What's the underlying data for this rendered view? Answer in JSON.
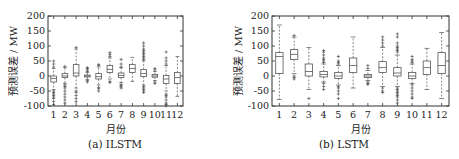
{
  "chart_data": [
    {
      "type": "box",
      "title": "",
      "caption": "(a) ILSTM",
      "xlabel": "月份",
      "ylabel": "预测误差 / MW",
      "ylim": [
        -100,
        200
      ],
      "yticks": [
        -100,
        -50,
        0,
        50,
        100,
        150,
        200
      ],
      "categories": [
        "1",
        "2",
        "3",
        "4",
        "5",
        "6",
        "7",
        "8",
        "9",
        "10",
        "11",
        "12"
      ],
      "boxes": [
        {
          "month": "1",
          "whisker_low": -45,
          "q1": -20,
          "median": -8,
          "q3": 0,
          "whisker_high": 25,
          "outliers": [
            30,
            40,
            50,
            -50,
            -55,
            -60,
            -65,
            -70,
            -75,
            -85,
            -95
          ]
        },
        {
          "month": "2",
          "whisker_low": -25,
          "q1": -5,
          "median": 0,
          "q3": 8,
          "whisker_high": 28,
          "outliers": [
            32,
            -30,
            -35,
            -40,
            -50,
            -60,
            -70,
            -80,
            -90
          ]
        },
        {
          "month": "3",
          "whisker_low": -40,
          "q1": 0,
          "median": 10,
          "q3": 38,
          "whisker_high": 90,
          "outliers": [
            95,
            -50,
            -55,
            -65,
            -75,
            -85
          ]
        },
        {
          "month": "4",
          "whisker_low": -12,
          "q1": -3,
          "median": 0,
          "q3": 3,
          "whisker_high": 12,
          "outliers": [
            15,
            20,
            25,
            28,
            -15,
            -20
          ]
        },
        {
          "month": "5",
          "whisker_low": -30,
          "q1": -10,
          "median": -2,
          "q3": 8,
          "whisker_high": 30,
          "outliers": [
            35,
            38,
            -38,
            -42,
            -50
          ]
        },
        {
          "month": "6",
          "whisker_low": -10,
          "q1": 12,
          "median": 22,
          "q3": 35,
          "whisker_high": 60,
          "outliers": [
            65,
            72,
            78,
            -18,
            -22
          ]
        },
        {
          "month": "7",
          "whisker_low": -22,
          "q1": -5,
          "median": 2,
          "q3": 10,
          "whisker_high": 28,
          "outliers": [
            30,
            40,
            55,
            -28,
            -32,
            -36,
            -40
          ]
        },
        {
          "month": "8",
          "whisker_low": -18,
          "q1": 12,
          "median": 25,
          "q3": 38,
          "whisker_high": 62,
          "outliers": []
        },
        {
          "month": "9",
          "whisker_low": -30,
          "q1": -2,
          "median": 8,
          "q3": 22,
          "whisker_high": 50,
          "outliers": [
            55,
            60,
            65,
            70,
            75,
            80,
            85,
            90,
            100,
            110,
            -35,
            -40,
            -45,
            -50,
            -55
          ]
        },
        {
          "month": "10",
          "whisker_low": -15,
          "q1": -4,
          "median": 0,
          "q3": 5,
          "whisker_high": 15,
          "outliers": [
            20,
            25,
            -20,
            -25
          ]
        },
        {
          "month": "11",
          "whisker_low": -50,
          "q1": -25,
          "median": -10,
          "q3": 2,
          "whisker_high": 35,
          "outliers": [
            40,
            50,
            60,
            80,
            -60,
            -65,
            -70,
            -80,
            -90,
            -95,
            -100
          ]
        },
        {
          "month": "12",
          "whisker_low": -68,
          "q1": -25,
          "median": -5,
          "q3": 12,
          "whisker_high": 65,
          "outliers": []
        }
      ]
    },
    {
      "type": "box",
      "title": "",
      "caption": "(b) LSTM",
      "xlabel": "月份",
      "ylabel": "预测误差 / MW",
      "ylim": [
        -100,
        200
      ],
      "yticks": [
        -100,
        -50,
        0,
        50,
        100,
        150,
        200
      ],
      "categories": [
        "1",
        "2",
        "3",
        "4",
        "5",
        "6",
        "7",
        "8",
        "9",
        "10",
        "11",
        "12"
      ],
      "boxes": [
        {
          "month": "1",
          "whisker_low": -78,
          "q1": 8,
          "median": 65,
          "q3": 78,
          "whisker_high": 170,
          "outliers": []
        },
        {
          "month": "2",
          "whisker_low": 8,
          "q1": 55,
          "median": 72,
          "q3": 88,
          "whisker_high": 130,
          "outliers": [
            135,
            0,
            -5,
            -10
          ]
        },
        {
          "month": "3",
          "whisker_low": -45,
          "q1": 0,
          "median": 15,
          "q3": 40,
          "whisker_high": 95,
          "outliers": [
            -75
          ]
        },
        {
          "month": "4",
          "whisker_low": -20,
          "q1": -3,
          "median": 5,
          "q3": 15,
          "whisker_high": 40,
          "outliers": [
            45,
            50,
            55,
            60,
            70,
            80,
            85,
            -25,
            -35,
            -45
          ]
        },
        {
          "month": "5",
          "whisker_low": -30,
          "q1": -8,
          "median": 0,
          "q3": 12,
          "whisker_high": 35,
          "outliers": [
            40,
            45,
            50,
            65,
            -35,
            -40,
            -50,
            -60,
            -75
          ]
        },
        {
          "month": "6",
          "whisker_low": -40,
          "q1": 12,
          "median": 35,
          "q3": 60,
          "whisker_high": 130,
          "outliers": []
        },
        {
          "month": "7",
          "whisker_low": -15,
          "q1": -5,
          "median": 0,
          "q3": 5,
          "whisker_high": 18,
          "outliers": [
            25,
            35,
            -20,
            -25,
            -28
          ]
        },
        {
          "month": "8",
          "whisker_low": -35,
          "q1": 12,
          "median": 28,
          "q3": 48,
          "whisker_high": 95,
          "outliers": [
            100,
            110,
            120,
            130,
            -40,
            -50,
            -55
          ]
        },
        {
          "month": "9",
          "whisker_low": -35,
          "q1": 0,
          "median": 10,
          "q3": 28,
          "whisker_high": 70,
          "outliers": [
            80,
            85,
            90,
            95,
            100,
            110,
            130,
            140,
            -40,
            -45,
            -50,
            -55,
            -60,
            -65,
            -70,
            -80,
            -90
          ]
        },
        {
          "month": "10",
          "whisker_low": -25,
          "q1": -8,
          "median": 0,
          "q3": 12,
          "whisker_high": 40,
          "outliers": [
            45,
            50,
            55,
            65,
            -30,
            -40,
            -50,
            -60,
            -70,
            -75
          ]
        },
        {
          "month": "11",
          "whisker_low": -45,
          "q1": 5,
          "median": 28,
          "q3": 50,
          "whisker_high": 92,
          "outliers": []
        },
        {
          "month": "12",
          "whisker_low": -75,
          "q1": 8,
          "median": 35,
          "q3": 78,
          "whisker_high": 145,
          "outliers": []
        }
      ]
    }
  ],
  "panels": [
    {
      "caption": "(a) ILSTM",
      "xlabel": "月份",
      "ylabel": "预测误差 / MW"
    },
    {
      "caption": "(b) LSTM",
      "xlabel": "月份",
      "ylabel": "预测误差 / MW"
    }
  ],
  "style": {
    "box_color": "#555555",
    "axis_color": "#333333",
    "outlier_color": "#555555"
  }
}
